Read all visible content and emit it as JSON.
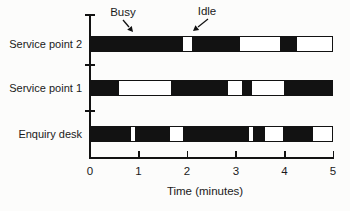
{
  "chart_data": {
    "type": "timeline",
    "title": "",
    "xlabel": "Time (minutes)",
    "xlim": [
      0,
      5
    ],
    "x_ticks": [
      0,
      1,
      2,
      3,
      4,
      5
    ],
    "state_legend": {
      "filled": "Busy",
      "empty": "Idle"
    },
    "colors": {
      "busy": "#121212",
      "idle": "#ffffff",
      "axis": "#121212"
    },
    "rows": [
      {
        "label": "Service point 2",
        "busy_intervals": [
          [
            0,
            1.9
          ],
          [
            2.08,
            3.08
          ],
          [
            3.92,
            4.27
          ]
        ]
      },
      {
        "label": "Service point 1",
        "busy_intervals": [
          [
            0,
            0.57
          ],
          [
            1.65,
            2.84
          ],
          [
            3.12,
            3.33
          ],
          [
            4.0,
            5.0
          ]
        ]
      },
      {
        "label": "Enquiry desk",
        "busy_intervals": [
          [
            0,
            0.82
          ],
          [
            0.9,
            1.62
          ],
          [
            1.9,
            3.27
          ],
          [
            3.35,
            3.6
          ],
          [
            3.97,
            4.6
          ]
        ]
      }
    ],
    "annotations": [
      {
        "label": "Busy",
        "target_row": "Service point 2",
        "target_x": 0.9
      },
      {
        "label": "Idle",
        "target_row": "Service point 2",
        "target_x": 2.0
      }
    ]
  }
}
